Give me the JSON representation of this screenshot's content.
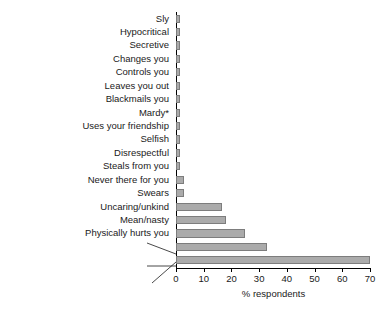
{
  "chart_data": {
    "type": "bar",
    "orientation": "horizontal",
    "title": "",
    "xlabel": "% respondents",
    "ylabel": "",
    "xlim": [
      0,
      70
    ],
    "xticks": [
      0,
      10,
      20,
      30,
      40,
      50,
      60,
      70
    ],
    "grid": false,
    "legend": null,
    "bar_color": "#ababab",
    "bar_border_color": "#7d7d7d",
    "axis_color": "#000000",
    "categories": [
      "Sly",
      "Hypocritical",
      "Secretive",
      "Changes you",
      "Controls you",
      "Leaves you out",
      "Blackmails you",
      "Mardy*",
      "Uses your friendship",
      "Selfish",
      "Disrespectful",
      "Steals from you",
      "Never there for you",
      "Swears",
      "Uncaring/unkind",
      "Mean/nasty",
      "Physically hurts you",
      "Calls you names/says mean things/ bitchy/spreads rumours",
      "Disloyal/untrustworthy/dishonest/ gives away your secrets/two-faced"
    ],
    "values": [
      1.5,
      1.5,
      1.5,
      1.5,
      1.5,
      1.5,
      1.5,
      1.5,
      1.5,
      1.5,
      1.5,
      1.5,
      3,
      3,
      16.5,
      18,
      25,
      33,
      70
    ],
    "bars": [
      {
        "label": "Sly",
        "value": 1.5,
        "wrapped": false
      },
      {
        "label": "Hypocritical",
        "value": 1.5,
        "wrapped": false
      },
      {
        "label": "Secretive",
        "value": 1.5,
        "wrapped": false
      },
      {
        "label": "Changes you",
        "value": 1.5,
        "wrapped": false
      },
      {
        "label": "Controls you",
        "value": 1.5,
        "wrapped": false
      },
      {
        "label": "Leaves you out",
        "value": 1.5,
        "wrapped": false
      },
      {
        "label": "Blackmails you",
        "value": 1.5,
        "wrapped": false
      },
      {
        "label": "Mardy*",
        "value": 1.5,
        "wrapped": false
      },
      {
        "label": "Uses your friendship",
        "value": 1.5,
        "wrapped": false
      },
      {
        "label": "Selfish",
        "value": 1.5,
        "wrapped": false
      },
      {
        "label": "Disrespectful",
        "value": 1.5,
        "wrapped": false
      },
      {
        "label": "Steals from you",
        "value": 1.5,
        "wrapped": false
      },
      {
        "label": "Never there for you",
        "value": 3,
        "wrapped": false
      },
      {
        "label": "Swears",
        "value": 3,
        "wrapped": false
      },
      {
        "label": "Uncaring/unkind",
        "value": 16.5,
        "wrapped": false
      },
      {
        "label": "Mean/nasty",
        "value": 18,
        "wrapped": false
      },
      {
        "label": "Physically hurts you",
        "value": 25,
        "wrapped": false
      },
      {
        "label": "Calls you names/says mean things/bitchy/spreads rumours",
        "value": 33,
        "wrapped": true,
        "lines": [
          "Calls you names/says mean things/",
          "bitchy/spreads rumours"
        ]
      },
      {
        "label": "Disloyal/untrustworthy/dishonest/gives away your secrets/two-faced",
        "value": 70,
        "wrapped": true,
        "lines": [
          "Disloyal/untrustworthy/dishonest/",
          "gives away your secrets/two-faced"
        ]
      }
    ]
  },
  "axis": {
    "x_title": "% respondents",
    "tick_labels": [
      "0",
      "10",
      "20",
      "30",
      "40",
      "50",
      "60",
      "70"
    ]
  }
}
